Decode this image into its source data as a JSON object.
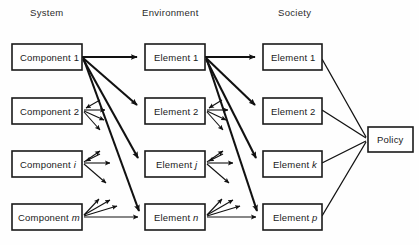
{
  "figure": {
    "background_color": "#fefefe",
    "line_color": "#111111",
    "text_color": "#1a1a1a"
  },
  "columns": [
    {
      "id": "system",
      "label": "System",
      "x": 30,
      "y": 16
    },
    {
      "id": "environment",
      "label": "Environment",
      "x": 142,
      "y": 16
    },
    {
      "id": "society",
      "label": "Society",
      "x": 278,
      "y": 16
    }
  ],
  "nodes": {
    "system": [
      {
        "id": "component-1",
        "text": "Component 1",
        "italic_suffix": "",
        "x": 12,
        "y": 44,
        "w": 70,
        "h": 26
      },
      {
        "id": "component-2",
        "text": "Component 2",
        "italic_suffix": "",
        "x": 12,
        "y": 98,
        "w": 70,
        "h": 26
      },
      {
        "id": "component-i",
        "text": "Component ",
        "italic_suffix": "i",
        "x": 12,
        "y": 151,
        "w": 70,
        "h": 26
      },
      {
        "id": "component-m",
        "text": "Component ",
        "italic_suffix": "m",
        "x": 12,
        "y": 204,
        "w": 70,
        "h": 26
      }
    ],
    "environment": [
      {
        "id": "env-element-1",
        "text": "Element 1",
        "italic_suffix": "",
        "x": 145,
        "y": 44,
        "w": 60,
        "h": 26
      },
      {
        "id": "env-element-2",
        "text": "Element 2",
        "italic_suffix": "",
        "x": 145,
        "y": 98,
        "w": 60,
        "h": 26
      },
      {
        "id": "env-element-j",
        "text": "Element ",
        "italic_suffix": "j",
        "x": 145,
        "y": 151,
        "w": 60,
        "h": 26
      },
      {
        "id": "env-element-n",
        "text": "Element ",
        "italic_suffix": "n",
        "x": 145,
        "y": 204,
        "w": 60,
        "h": 26
      }
    ],
    "society": [
      {
        "id": "soc-element-1",
        "text": "Element 1",
        "italic_suffix": "",
        "x": 263,
        "y": 44,
        "w": 59,
        "h": 26
      },
      {
        "id": "soc-element-2",
        "text": "Element 2",
        "italic_suffix": "",
        "x": 263,
        "y": 98,
        "w": 59,
        "h": 26
      },
      {
        "id": "soc-element-k",
        "text": "Element ",
        "italic_suffix": "k",
        "x": 263,
        "y": 151,
        "w": 59,
        "h": 26
      },
      {
        "id": "soc-element-p",
        "text": "Element ",
        "italic_suffix": "p",
        "x": 263,
        "y": 204,
        "w": 59,
        "h": 26
      }
    ],
    "policy": [
      {
        "id": "policy",
        "text": "Policy",
        "italic_suffix": "",
        "x": 368,
        "y": 127,
        "w": 45,
        "h": 25
      }
    ]
  },
  "edges": {
    "system_to_environment": {
      "source": "component-1",
      "origin": {
        "x": 82,
        "y": 57
      },
      "targets": [
        {
          "to": "env-element-1",
          "x": 143,
          "y": 57
        },
        {
          "to": "env-element-2",
          "x": 143,
          "y": 107
        },
        {
          "to": "env-element-j",
          "x": 143,
          "y": 160
        },
        {
          "to": "env-element-n",
          "x": 143,
          "y": 213
        }
      ],
      "style": "thick-arrow"
    },
    "environment_to_society": {
      "source": "env-element-1",
      "origin": {
        "x": 205,
        "y": 57
      },
      "targets": [
        {
          "to": "soc-element-1",
          "x": 261,
          "y": 57
        },
        {
          "to": "soc-element-2",
          "x": 261,
          "y": 107
        },
        {
          "to": "soc-element-k",
          "x": 261,
          "y": 160
        },
        {
          "to": "soc-element-p",
          "x": 261,
          "y": 213
        }
      ],
      "style": "thick-arrow"
    },
    "society_to_policy": {
      "target": "policy",
      "sink": {
        "x": 366,
        "y": 139
      },
      "sources": [
        {
          "from": "soc-element-1",
          "x": 322,
          "y": 59
        },
        {
          "from": "soc-element-2",
          "x": 322,
          "y": 110
        },
        {
          "from": "soc-element-k",
          "x": 322,
          "y": 163
        },
        {
          "from": "soc-element-p",
          "x": 322,
          "y": 216
        }
      ],
      "style": "plain-line"
    },
    "radiating_groups": [
      {
        "id": "radiate-component-2",
        "anchor": {
          "x": 84,
          "y": 110
        },
        "inbound": true,
        "rays": 3
      },
      {
        "id": "radiate-component-i",
        "anchor": {
          "x": 84,
          "y": 163
        },
        "inbound": true,
        "rays": 3
      },
      {
        "id": "radiate-component-m",
        "anchor": {
          "x": 84,
          "y": 216
        },
        "inbound": true,
        "rays": 3
      },
      {
        "id": "radiate-env-element-2",
        "anchor": {
          "x": 207,
          "y": 110
        },
        "inbound": true,
        "rays": 3
      },
      {
        "id": "radiate-env-element-j",
        "anchor": {
          "x": 207,
          "y": 163
        },
        "inbound": true,
        "rays": 3
      },
      {
        "id": "radiate-env-element-n",
        "anchor": {
          "x": 207,
          "y": 216
        },
        "inbound": true,
        "rays": 3
      }
    ]
  }
}
